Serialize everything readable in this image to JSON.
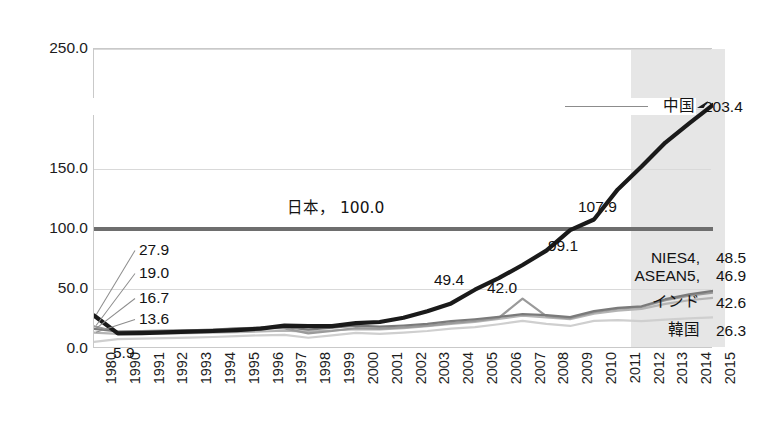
{
  "chart_data": {
    "type": "line",
    "title": "",
    "subtitle": "",
    "xlabel": "",
    "ylabel": "",
    "grid": true,
    "legend_position": "inline-right",
    "ylim": [
      0,
      250
    ],
    "yticks": [
      "0.0",
      "50.0",
      "100.0",
      "150.0",
      "200.0",
      "250.0"
    ],
    "ytick_values": [
      0,
      50,
      100,
      150,
      200,
      250
    ],
    "categories": [
      "1980",
      "1990",
      "1991",
      "1992",
      "1993",
      "1994",
      "1995",
      "1996",
      "1997",
      "1998",
      "1999",
      "2000",
      "2001",
      "2002",
      "2003",
      "2004",
      "2005",
      "2006",
      "2007",
      "2008",
      "2009",
      "2010",
      "2011",
      "2012",
      "2013",
      "2014",
      "2015"
    ],
    "highlight_band": {
      "from": "2012",
      "to": "2015",
      "color": "#e6e6e6"
    },
    "series": [
      {
        "name": "中国",
        "color": "#1a1a1a",
        "width": 4.2,
        "end_value": 203.4,
        "values": [
          27.9,
          13.0,
          13.2,
          13.8,
          14.4,
          15.0,
          15.8,
          17.0,
          19.5,
          19.0,
          19.0,
          21.5,
          22.5,
          26.0,
          31.5,
          38.0,
          49.4,
          59.0,
          70.0,
          82.0,
          99.1,
          107.9,
          133.0,
          152.0,
          172.0,
          188.0,
          203.4
        ]
      },
      {
        "name": "NIES4",
        "color": "#7a7a7a",
        "width": 2.2,
        "end_value": 48.5,
        "values": [
          16.7,
          14.6,
          15.0,
          15.3,
          15.6,
          16.2,
          17.3,
          17.8,
          18.2,
          16.2,
          17.8,
          19.5,
          18.6,
          19.6,
          21.0,
          23.3,
          24.8,
          26.7,
          29.0,
          28.2,
          26.6,
          31.6,
          34.3,
          35.6,
          41.5,
          45.5,
          48.5
        ]
      },
      {
        "name": "ASEAN5",
        "color": "#9a9a9a",
        "width": 2.2,
        "end_value": 46.9,
        "values": [
          19.0,
          14.2,
          14.6,
          15.0,
          15.4,
          16.0,
          17.0,
          17.6,
          17.2,
          13.0,
          15.0,
          17.5,
          17.0,
          18.0,
          19.4,
          21.6,
          23.4,
          26.0,
          42.0,
          27.4,
          25.6,
          30.6,
          33.6,
          35.0,
          40.6,
          44.5,
          46.9
        ]
      },
      {
        "name": "インド",
        "color": "#b4b4b4",
        "width": 2.2,
        "end_value": 42.6,
        "values": [
          13.6,
          12.6,
          12.8,
          13.0,
          13.2,
          13.6,
          14.1,
          14.6,
          15.2,
          14.4,
          15.4,
          16.6,
          16.4,
          17.4,
          19.0,
          21.0,
          22.6,
          25.0,
          27.8,
          26.4,
          24.8,
          29.4,
          32.0,
          33.4,
          37.6,
          40.6,
          42.6
        ]
      },
      {
        "name": "韓国",
        "color": "#cfcfcf",
        "width": 2.2,
        "end_value": 26.3,
        "values": [
          5.9,
          8.2,
          8.6,
          9.0,
          9.4,
          10.0,
          10.8,
          11.4,
          11.8,
          9.4,
          11.4,
          13.4,
          12.6,
          13.6,
          15.0,
          17.0,
          18.2,
          20.6,
          23.4,
          21.0,
          19.2,
          23.4,
          24.0,
          23.2,
          24.4,
          25.6,
          26.3
        ]
      },
      {
        "name": "日本",
        "color": "#6e6e6e",
        "width": 4.0,
        "end_value": 100.0,
        "values": [
          100,
          100,
          100,
          100,
          100,
          100,
          100,
          100,
          100,
          100,
          100,
          100,
          100,
          100,
          100,
          100,
          100,
          100,
          100,
          100,
          100,
          100,
          100,
          100,
          100,
          100,
          100
        ]
      }
    ],
    "annotations": {
      "left_callouts": [
        {
          "text": "27.9",
          "series": "中国",
          "value": 27.9
        },
        {
          "text": "19.0",
          "series": "ASEAN5",
          "value": 19.0
        },
        {
          "text": "16.7",
          "series": "NIES4",
          "value": 16.7
        },
        {
          "text": "13.6",
          "series": "インド",
          "value": 13.6
        },
        {
          "text": "5.9",
          "series": "韓国",
          "value": 5.9
        }
      ],
      "inline": [
        {
          "text": "日本，   100.0",
          "series": "日本",
          "value": 100.0
        },
        {
          "text": "49.4",
          "series": "中国",
          "value": 49.4
        },
        {
          "text": "42.0",
          "series": "ASEAN5",
          "value": 42.0
        },
        {
          "text": "99.1",
          "series": "中国",
          "value": 99.1
        },
        {
          "text": "107.9",
          "series": "中国",
          "value": 107.9
        }
      ],
      "right_labels": [
        {
          "name": "中国",
          "value": "203.4"
        },
        {
          "name": "NIES4,",
          "value": "48.5"
        },
        {
          "name": "ASEAN5,",
          "value": "46.9"
        },
        {
          "name": "インド",
          "value": "42.6"
        },
        {
          "name": "韓国",
          "value": "26.3"
        }
      ]
    }
  }
}
